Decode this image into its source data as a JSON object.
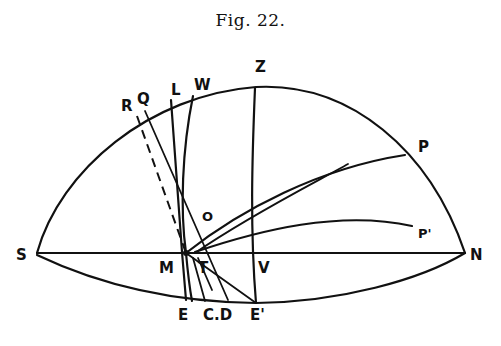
{
  "figure": {
    "title": "Fig. 22.",
    "labels": {
      "R": "R",
      "Q": "Q",
      "L": "L",
      "W": "W",
      "Z": "Z",
      "P": "P",
      "P_prime": "P'",
      "O": "O",
      "S": "S",
      "N": "N",
      "M": "M",
      "T": "T",
      "V": "V",
      "E": "E",
      "CD": "C.D",
      "E_prime": "E'"
    },
    "colors": {
      "ink": "#111111",
      "paper": "#ffffff"
    }
  }
}
